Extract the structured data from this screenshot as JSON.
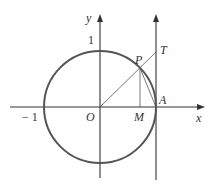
{
  "diagram": {
    "labels": {
      "y_axis": "y",
      "x_axis": "x",
      "one": "1",
      "neg_one": "− 1",
      "origin": "O",
      "P": "P",
      "T": "T",
      "A": "A",
      "M": "M"
    },
    "colors": {
      "circle": "#555555",
      "axes": "#333333",
      "lines": "#555555"
    }
  }
}
